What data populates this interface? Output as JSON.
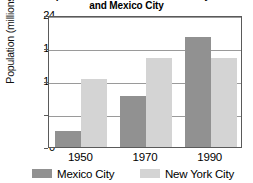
{
  "chart_data": {
    "type": "bar",
    "title": "and Mexico City",
    "title_note": "Population Growth in New York City\nand Mexico City",
    "xlabel": "",
    "ylabel": "Population (millions)",
    "categories": [
      "1950",
      "1970",
      "1990"
    ],
    "series": [
      {
        "name": "Mexico City",
        "color": "#919191",
        "values": [
          3.0,
          9.2,
          20.0
        ]
      },
      {
        "name": "New York City",
        "color": "#d4d4d4",
        "values": [
          12.3,
          16.2,
          16.2
        ]
      }
    ],
    "ylim": [
      0,
      24
    ],
    "yticks": [
      0,
      6,
      12,
      18,
      24
    ],
    "ytick_labels": [
      "0",
      "6",
      "12",
      "18",
      "24"
    ],
    "grid": true,
    "grid_axis": "y",
    "legend_position": "bottom"
  },
  "axes": {
    "y_title": "Population (millions)",
    "y_labels": [
      "24",
      "18",
      "12",
      "6",
      "0"
    ],
    "x_labels": [
      "1950",
      "1970",
      "1990"
    ]
  },
  "legend": {
    "items": [
      {
        "label": "Mexico City",
        "color": "#919191"
      },
      {
        "label": "New York City",
        "color": "#d4d4d4"
      }
    ]
  },
  "colors": {
    "mexico_city": "#919191",
    "new_york_city": "#d4d4d4",
    "axis": "#5a5a5a",
    "gridline": "#9a9a9a",
    "background": "#ffffff",
    "text": "#000000"
  }
}
